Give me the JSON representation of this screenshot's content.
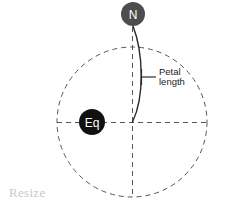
{
  "diagram": {
    "type": "sphere-petal-schematic",
    "background_color": "#ffffff",
    "globe": {
      "name": "globe-outline",
      "center_x": 132,
      "center_y": 122,
      "radius": 75,
      "stroke_color": "#555555",
      "style": "dashed"
    },
    "equator_line": {
      "name": "equator-line",
      "x1": 57,
      "x2": 207,
      "y": 122,
      "stroke_color": "#555555",
      "style": "dashed"
    },
    "meridian_line": {
      "name": "meridian-line",
      "x": 132,
      "y1": 26,
      "y2": 197,
      "stroke_color": "#555555",
      "style": "dashed"
    },
    "north_pole_marker": {
      "label": "N",
      "center_x": 133,
      "center_y": 14,
      "radius": 12,
      "fill_color": "#4d4d4d",
      "text_color": "#ffffff",
      "font_size": 11
    },
    "equator_marker": {
      "label": "Eq",
      "center_x": 92,
      "center_y": 122,
      "radius": 13,
      "fill_color": "#111111",
      "text_color": "#ffffff",
      "font_size": 11
    },
    "petal_arc": {
      "name": "petal-arc",
      "stroke_color": "#2a2a2a",
      "start_x": 133,
      "start_y": 26,
      "end_x": 132,
      "end_y": 122,
      "bulge_x": 144
    },
    "callout": {
      "label_line1": "Petal",
      "label_line2": "length",
      "tick_x": 141,
      "tick_y1": 69,
      "tick_y2": 85,
      "leader_x1": 141,
      "leader_x2": 155,
      "leader_y": 77,
      "text_x": 158,
      "text_y": 74,
      "stroke_color": "#2a2a2a"
    },
    "resize_label": {
      "text": "Resize",
      "x": 9,
      "y": 197,
      "color": "#c9c9c9"
    }
  }
}
